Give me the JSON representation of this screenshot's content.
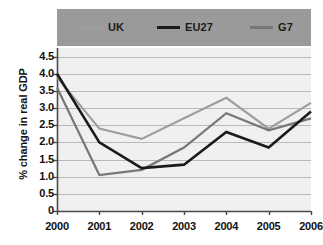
{
  "chart_data": {
    "type": "line",
    "title": "",
    "xlabel": "",
    "ylabel": "% change in real GDP",
    "categories": [
      "2000",
      "2001",
      "2002",
      "2003",
      "2004",
      "2005",
      "2006"
    ],
    "x": [
      2000,
      2001,
      2002,
      2003,
      2004,
      2005,
      2006
    ],
    "ylim": [
      0,
      4.75
    ],
    "y_ticks": [
      "4.5",
      "4.0",
      "3.5",
      "3.0",
      "2.5",
      "2.0",
      "1.5",
      "1.0",
      "0.5",
      "0"
    ],
    "y_tick_values": [
      4.5,
      4.0,
      3.5,
      3.0,
      2.5,
      2.0,
      1.5,
      1.0,
      0.5,
      0
    ],
    "grid": true,
    "legend_position": "top",
    "series": [
      {
        "name": "UK",
        "color": "#9e9e9e",
        "values": [
          3.9,
          2.4,
          2.1,
          2.7,
          3.3,
          2.4,
          3.15
        ]
      },
      {
        "name": "EU27",
        "color": "#1b1b1b",
        "values": [
          4.0,
          2.0,
          1.25,
          1.35,
          2.3,
          1.85,
          2.9
        ]
      },
      {
        "name": "G7",
        "color": "#777777",
        "values": [
          3.6,
          1.05,
          1.2,
          1.85,
          2.85,
          2.35,
          2.7
        ]
      }
    ]
  },
  "legend": {
    "items": [
      {
        "label": "UK",
        "color": "#9e9e9e"
      },
      {
        "label": "EU27",
        "color": "#1b1b1b"
      },
      {
        "label": "G7",
        "color": "#777777"
      }
    ],
    "band_color": "#9a9a9a"
  },
  "axes": {
    "y_title": "% change in real GDP",
    "axis_color": "#4a4a4a",
    "grid_color": "#b9b9b9",
    "plot_background": "#f0f0f0"
  }
}
